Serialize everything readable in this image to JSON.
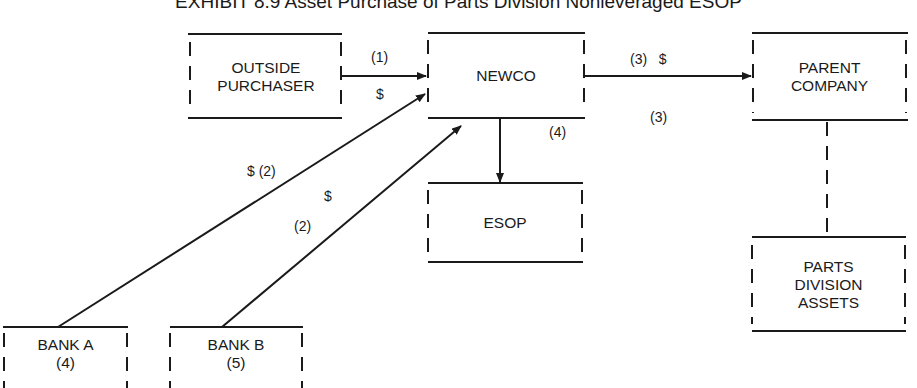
{
  "title": "EXHIBIT 8.9 Asset Purchase of Parts Division Nonleveraged ESOP",
  "colors": {
    "ink": "#1a1a1a",
    "background": "#ffffff"
  },
  "nodes": {
    "outside_purchaser": {
      "line1": "OUTSIDE",
      "line2": "PURCHASER"
    },
    "newco": {
      "label": "NEWCO"
    },
    "parent_company": {
      "line1": "PARENT",
      "line2": "COMPANY"
    },
    "esop": {
      "label": "ESOP"
    },
    "parts_division_assets": {
      "line1": "PARTS",
      "line2": "DIVISION",
      "line3": "ASSETS"
    },
    "bank_a": {
      "line1": "BANK A",
      "line2": "(4)"
    },
    "bank_b": {
      "line1": "BANK B",
      "line2": "(5)"
    }
  },
  "edges": {
    "purchaser_to_newco": {
      "step": "(1)",
      "flow": "$"
    },
    "newco_to_parent": {
      "step_flow": "(3)   $",
      "step_below": "(3)"
    },
    "newco_to_esop": {
      "step": "(4)"
    },
    "bank_a_to_newco": {
      "label": "$ (2)"
    },
    "bank_b_to_newco": {
      "flow": "$",
      "step": "(2)"
    },
    "parent_to_parts": {
      "style": "dashed"
    }
  }
}
